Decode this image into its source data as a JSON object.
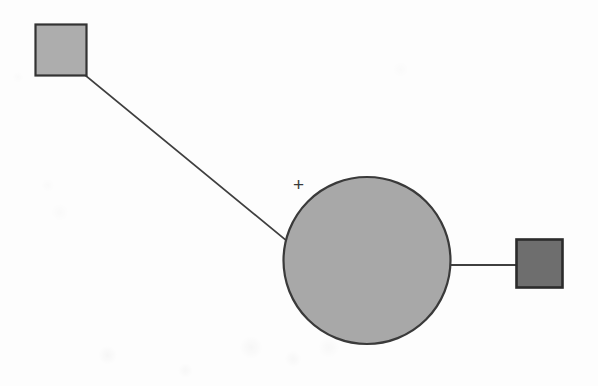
{
  "figure": {
    "background_color": "#fdfdfd",
    "width": 598,
    "height": 386,
    "annotation_plus": "+"
  },
  "palette": {
    "square_light_fill": "#adadad",
    "square_dark_fill": "#6e6e6e",
    "circle_fill": "#a8a8a8",
    "outline": "#333333",
    "line": "#3f3f3f",
    "background": "#fdfdfd"
  },
  "nodes": [
    {
      "id": "node-male-affected-upper-left",
      "shape": "square",
      "label": "",
      "fill": "#adadad",
      "stroke": "#333333",
      "x": 35,
      "y": 24,
      "width": 52,
      "height": 52
    },
    {
      "id": "node-female-proband",
      "shape": "circle",
      "label": "",
      "fill": "#a8a8a8",
      "stroke": "#3a3a3a",
      "cx": 367,
      "cy": 260,
      "r": 84
    },
    {
      "id": "node-male-affected-right",
      "shape": "square",
      "label": "",
      "fill": "#6e6e6e",
      "stroke": "#2b2b2b",
      "x": 516,
      "y": 239,
      "width": 47,
      "height": 49
    }
  ],
  "edges": [
    {
      "id": "edge-upperleft-to-circle",
      "type": "diagonal",
      "from": "node-male-affected-upper-left",
      "to": "node-female-proband",
      "x1": 86,
      "y1": 76,
      "x2": 287,
      "y2": 241,
      "stroke": "#3f3f3f",
      "stroke_width": 1.8
    },
    {
      "id": "edge-circle-to-right-square",
      "type": "horizontal",
      "from": "node-female-proband",
      "to": "node-male-affected-right",
      "x1": 450,
      "y1": 265,
      "x2": 517,
      "y2": 265,
      "stroke": "#3f3f3f",
      "stroke_width": 1.8
    }
  ],
  "annotations": [
    {
      "id": "plus-marker",
      "text": "+",
      "x": 294,
      "y": 175,
      "color": "#3a3a3a"
    }
  ]
}
